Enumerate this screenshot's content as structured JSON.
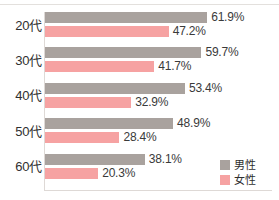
{
  "chart_data": {
    "type": "bar",
    "orientation": "horizontal",
    "title": "",
    "subtitle": "",
    "xlabel": "",
    "ylabel": "",
    "categories": [
      "20代",
      "30代",
      "40代",
      "50代",
      "60代"
    ],
    "series": [
      {
        "name": "男性",
        "color": "#a9a29e",
        "values": [
          61.9,
          59.7,
          53.4,
          48.9,
          38.1
        ],
        "labels": [
          "61.9%",
          "59.7%",
          "53.4%",
          "48.9%",
          "38.1%"
        ]
      },
      {
        "name": "女性",
        "color": "#f6a2a2",
        "values": [
          47.2,
          41.7,
          32.9,
          28.4,
          20.3
        ],
        "labels": [
          "47.2%",
          "41.7%",
          "32.9%",
          "28.4%",
          "20.3%"
        ]
      }
    ],
    "xlim": [
      0,
      70
    ],
    "grid": false,
    "value_labels": true,
    "legend_position": "bottom-right",
    "unit": "%"
  },
  "legend": {
    "items": [
      {
        "label": "男性",
        "color": "#a9a29e",
        "swatch": "male-swatch"
      },
      {
        "label": "女性",
        "color": "#f6a2a2",
        "swatch": "female-swatch"
      }
    ]
  },
  "axis": {
    "categories": [
      "20代",
      "30代",
      "40代",
      "50代",
      "60代"
    ]
  },
  "colors": {
    "male": "#a9a29e",
    "female": "#f6a2a2",
    "axis": "#ded9d6",
    "text": "#3a3a3a",
    "background": "#ffffff"
  }
}
